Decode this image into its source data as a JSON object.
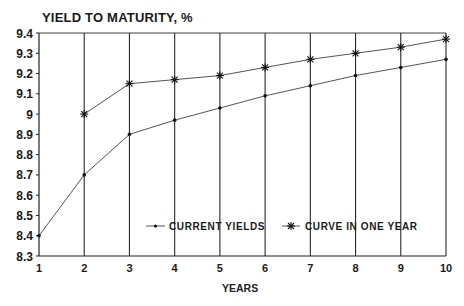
{
  "chart_data": {
    "type": "line",
    "title": "YIELD TO MATURITY, %",
    "xlabel": "YEARS",
    "ylabel": "YIELD TO MATURITY, %",
    "x": [
      1,
      2,
      3,
      4,
      5,
      6,
      7,
      8,
      9,
      10
    ],
    "x_ticks": [
      "1",
      "2",
      "3",
      "4",
      "5",
      "6",
      "7",
      "8",
      "9",
      "10"
    ],
    "y_ticks": [
      "8.3",
      "8.4",
      "8.5",
      "8.6",
      "8.7",
      "8.8",
      "8.9",
      "9",
      "9.1",
      "9.2",
      "9.3",
      "9.4"
    ],
    "xlim": [
      1,
      10
    ],
    "ylim": [
      8.3,
      9.4
    ],
    "grid": "vertical lines at each year",
    "legend_position": "inside lower center",
    "series": [
      {
        "name": "CURRENT YIELDS",
        "marker": "dot",
        "x": [
          1,
          2,
          3,
          4,
          5,
          6,
          7,
          8,
          9,
          10
        ],
        "values": [
          8.4,
          8.7,
          8.9,
          8.97,
          9.03,
          9.09,
          9.14,
          9.19,
          9.23,
          9.27
        ]
      },
      {
        "name": "CURVE IN ONE YEAR",
        "marker": "star",
        "x": [
          2,
          3,
          4,
          5,
          6,
          7,
          8,
          9,
          10
        ],
        "values": [
          9.0,
          9.15,
          9.17,
          9.19,
          9.23,
          9.27,
          9.3,
          9.33,
          9.37
        ]
      }
    ]
  },
  "colors": {
    "line": "#555555",
    "axis": "#222222",
    "text": "#1a1a1a"
  }
}
